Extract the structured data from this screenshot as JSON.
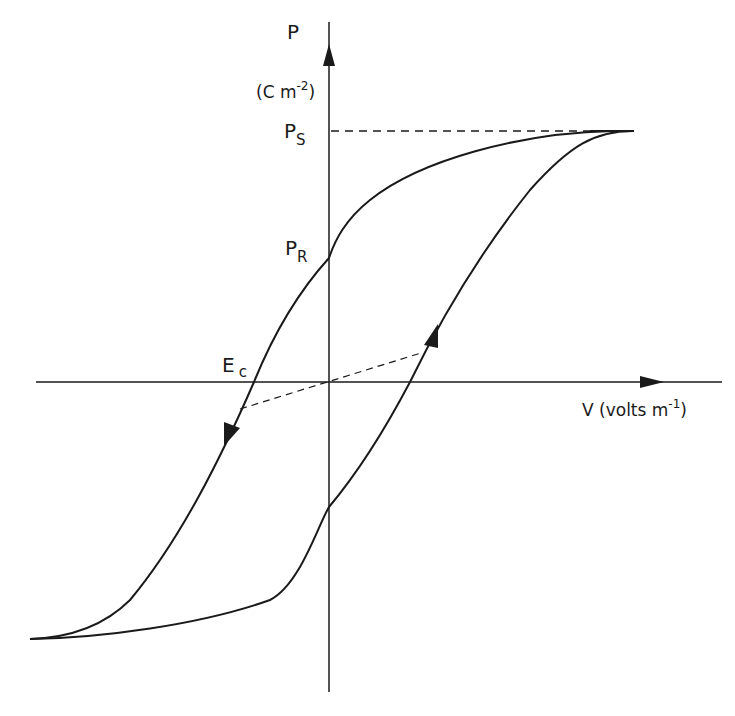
{
  "diagram": {
    "y_axis": {
      "symbol": "P",
      "unit_open": "(C m",
      "unit_exp": "-2",
      "unit_close": ")"
    },
    "x_axis": {
      "label": "V (volts m",
      "label_exp": "-1",
      "label_close": ")"
    },
    "labels": {
      "ps_main": "P",
      "ps_sub": "S",
      "pr_main": "P",
      "pr_sub": "R",
      "ec_main": "E",
      "ec_sub": "c"
    },
    "colors": {
      "line": "#1a1a1a",
      "background": "#ffffff"
    }
  }
}
